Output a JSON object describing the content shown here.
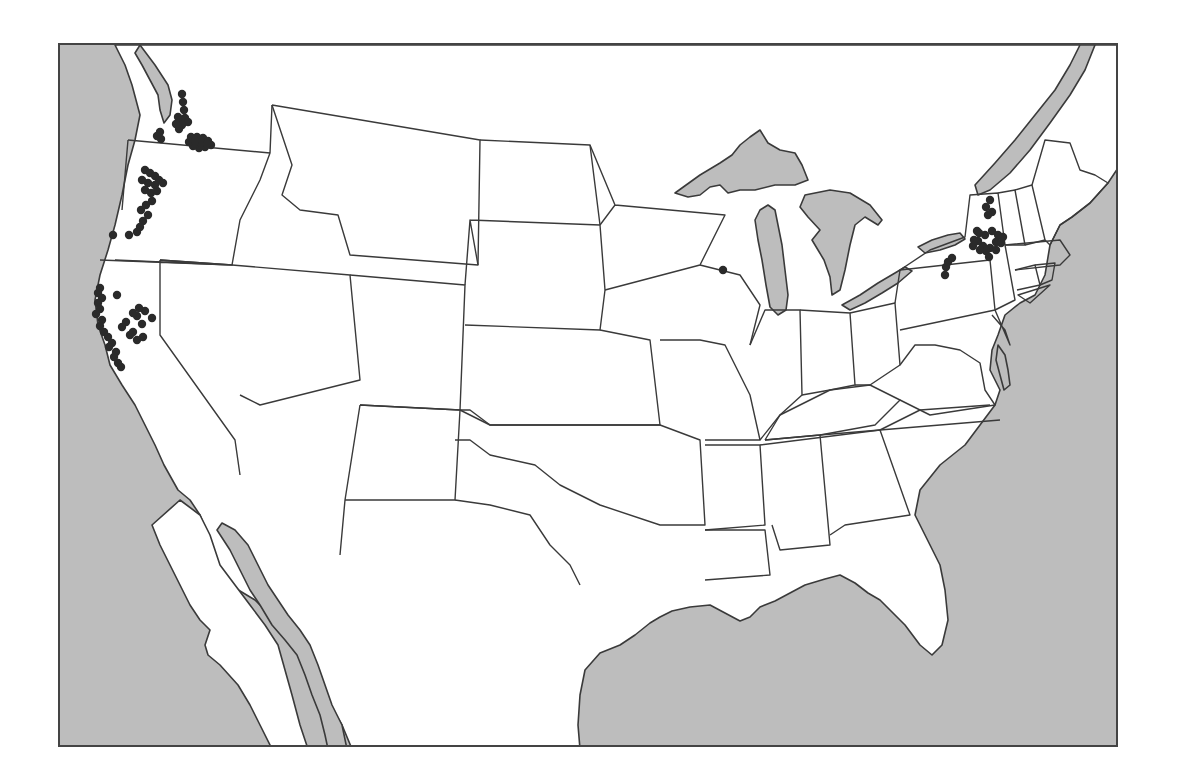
{
  "map": {
    "type": "dot-distribution-map",
    "region": "Contiguous United States",
    "colors": {
      "ocean": "#bdbdbd",
      "land": "#ffffff",
      "border": "#3a3a3a",
      "dot": "#2a2a2a",
      "frame": "#444444"
    },
    "dot_radius": 4.2,
    "clusters": [
      {
        "name": "western-washington-puget-sound",
        "points": [
          [
            122,
            49
          ],
          [
            123,
            57
          ],
          [
            124,
            65
          ],
          [
            118,
            72
          ],
          [
            121,
            75
          ],
          [
            125,
            73
          ],
          [
            128,
            77
          ],
          [
            122,
            80
          ],
          [
            119,
            84
          ],
          [
            116,
            79
          ],
          [
            100,
            87
          ],
          [
            97,
            91
          ],
          [
            101,
            94
          ]
        ]
      },
      {
        "name": "eastern-washington",
        "points": [
          [
            131,
            92
          ],
          [
            137,
            92
          ],
          [
            143,
            93
          ],
          [
            148,
            96
          ],
          [
            151,
            100
          ],
          [
            145,
            102
          ],
          [
            139,
            103
          ],
          [
            133,
            101
          ],
          [
            129,
            97
          ],
          [
            141,
            98
          ],
          [
            147,
            99
          ],
          [
            135,
            96
          ]
        ]
      },
      {
        "name": "western-oregon",
        "points": [
          [
            85,
            125
          ],
          [
            90,
            128
          ],
          [
            95,
            131
          ],
          [
            99,
            135
          ],
          [
            103,
            138
          ],
          [
            95,
            140
          ],
          [
            88,
            138
          ],
          [
            82,
            135
          ],
          [
            85,
            145
          ],
          [
            91,
            148
          ],
          [
            97,
            146
          ],
          [
            92,
            156
          ],
          [
            86,
            160
          ],
          [
            81,
            165
          ],
          [
            88,
            170
          ],
          [
            83,
            176
          ],
          [
            80,
            182
          ],
          [
            77,
            187
          ]
        ]
      },
      {
        "name": "southern-oregon-scattered",
        "points": [
          [
            53,
            190
          ],
          [
            69,
            190
          ]
        ]
      },
      {
        "name": "northern-california-coast",
        "points": [
          [
            40,
            243
          ],
          [
            38,
            248
          ],
          [
            42,
            253
          ],
          [
            38,
            258
          ],
          [
            40,
            264
          ],
          [
            36,
            269
          ],
          [
            42,
            275
          ],
          [
            40,
            281
          ],
          [
            44,
            287
          ],
          [
            48,
            292
          ],
          [
            52,
            298
          ],
          [
            49,
            302
          ],
          [
            56,
            307
          ],
          [
            54,
            312
          ],
          [
            58,
            318
          ],
          [
            61,
            322
          ]
        ]
      },
      {
        "name": "sacramento-valley",
        "points": [
          [
            73,
            287
          ],
          [
            82,
            279
          ],
          [
            77,
            271
          ],
          [
            85,
            266
          ],
          [
            79,
            263
          ],
          [
            73,
            268
          ],
          [
            66,
            277
          ],
          [
            83,
            292
          ],
          [
            77,
            295
          ],
          [
            70,
            290
          ],
          [
            92,
            273
          ],
          [
            57,
            250
          ],
          [
            62,
            282
          ]
        ]
      },
      {
        "name": "wisconsin",
        "points": [
          [
            663,
            225
          ]
        ]
      },
      {
        "name": "new-york-north",
        "points": [
          [
            930,
            155
          ],
          [
            926,
            162
          ],
          [
            932,
            167
          ],
          [
            928,
            170
          ]
        ]
      },
      {
        "name": "new-york-central",
        "points": [
          [
            925,
            190
          ],
          [
            932,
            186
          ],
          [
            938,
            190
          ],
          [
            936,
            197
          ],
          [
            930,
            203
          ],
          [
            923,
            201
          ],
          [
            918,
            196
          ],
          [
            941,
            198
          ],
          [
            926,
            206
          ],
          [
            919,
            188
          ],
          [
            914,
            195
          ],
          [
            936,
            205
          ],
          [
            943,
            192
          ],
          [
            920,
            205
          ],
          [
            929,
            212
          ],
          [
            913,
            201
          ]
        ]
      },
      {
        "name": "new-york-finger-lakes",
        "points": [
          [
            888,
            217
          ],
          [
            892,
            213
          ],
          [
            886,
            222
          ],
          [
            885,
            230
          ]
        ]
      },
      {
        "name": "new-york-scattered",
        "points": [
          [
            917,
            186
          ]
        ]
      }
    ]
  }
}
